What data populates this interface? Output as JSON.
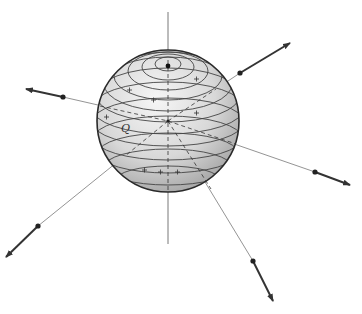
{
  "figure": {
    "label_point": "Q",
    "colors": {
      "background": "#ffffff",
      "sphere_edge": "#2a2a2a",
      "latitude_lines": "#444444",
      "axis_lines": "#555555",
      "arrow": "#333333"
    },
    "plus_marks_count": 9,
    "arrows_count": 6
  }
}
